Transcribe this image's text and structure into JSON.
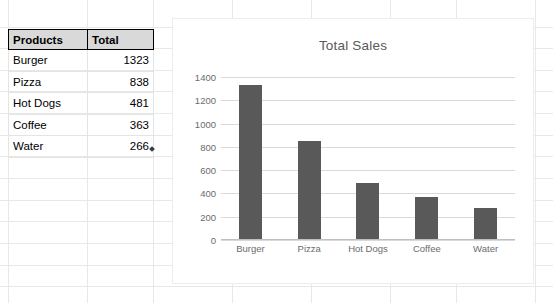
{
  "sheet": {
    "table": {
      "headers": [
        "Products",
        "Total"
      ],
      "rows": [
        [
          "Burger",
          "1323"
        ],
        [
          "Pizza",
          "838"
        ],
        [
          "Hot Dogs",
          "481"
        ],
        [
          "Coffee",
          "363"
        ],
        [
          "Water",
          "266"
        ]
      ]
    }
  },
  "chart": {
    "title": "Total Sales"
  },
  "chart_data": {
    "type": "bar",
    "title": "Total Sales",
    "categories": [
      "Burger",
      "Pizza",
      "Hot Dogs",
      "Coffee",
      "Water"
    ],
    "values": [
      1323,
      838,
      481,
      363,
      266
    ],
    "series": [
      {
        "name": "Total",
        "values": [
          1323,
          838,
          481,
          363,
          266
        ]
      }
    ],
    "xlabel": "",
    "ylabel": "",
    "ylim": [
      0,
      1400
    ],
    "yticks": [
      1400,
      1200,
      1000,
      800,
      600,
      400,
      200,
      0
    ],
    "grid": true,
    "legend": false,
    "bar_color": "#595959",
    "gridline_color": "#d9d9d9",
    "title_color": "#595959",
    "tick_label_color": "#6b6b6b"
  }
}
